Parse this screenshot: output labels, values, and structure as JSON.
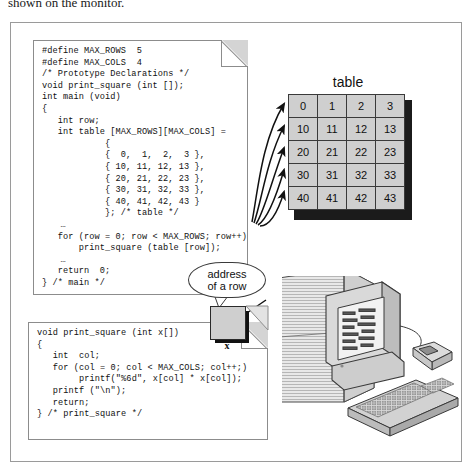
{
  "caption": "shown on the monitor.",
  "code_main": {
    "title": "main-function-code",
    "lines": [
      "#define MAX_ROWS  5",
      "#define MAX_COLS  4",
      "/* Prototype Declarations */",
      "void print_square (int []);",
      "int main (void)",
      "{",
      "   int row;",
      "   int table [MAX_ROWS][MAX_COLS] =",
      "            {",
      "            {  0,  1,  2,  3 },",
      "            { 10, 11, 12, 13 },",
      "            { 20, 21, 22, 23 },",
      "            { 30, 31, 32, 33 },",
      "            { 40, 41, 42, 43 }",
      "            }; /* table */",
      "   …",
      "   for (row = 0; row < MAX_ROWS; row++)",
      "       print_square (table [row]);",
      "   …",
      "   return  0;",
      "} /* main */"
    ]
  },
  "code_function": {
    "title": "print-square-function-code",
    "lines": [
      "void print_square (int x[])",
      "{",
      "   int  col;",
      "   for (col = 0; col < MAX_COLS; col++;)",
      "        printf(\"%6d\", x[col] * x[col]);",
      "   printf (\"\\n\");",
      "   return;",
      "} /* print_square */"
    ]
  },
  "table": {
    "label": "table",
    "rows": [
      [
        "0",
        "1",
        "2",
        "3"
      ],
      [
        "10",
        "11",
        "12",
        "13"
      ],
      [
        "20",
        "21",
        "22",
        "23"
      ],
      [
        "30",
        "31",
        "32",
        "33"
      ],
      [
        "40",
        "41",
        "42",
        "43"
      ]
    ]
  },
  "callout": {
    "line1": "address",
    "line2": "of a row"
  },
  "parameter_box": {
    "label": "x"
  },
  "colors": {
    "cell_fill": "#cfcfcf",
    "cell_border": "#3a3a3a",
    "shadow": "#1b1b1b",
    "frame": "#9a9a9a",
    "page_border": "#8c8c8c",
    "fold": "#d4d4d4"
  },
  "illustration": {
    "name": "desktop-computer",
    "parts": [
      "tower",
      "monitor",
      "screen",
      "keyboard",
      "mouse"
    ]
  }
}
